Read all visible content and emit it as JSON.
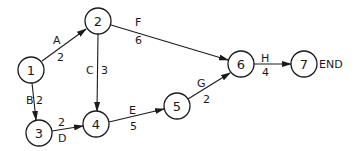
{
  "diagram": {
    "type": "activity-network",
    "nodes": [
      {
        "id": "1",
        "label": "1",
        "x": 31,
        "y": 70
      },
      {
        "id": "2",
        "label": "2",
        "x": 98,
        "y": 21
      },
      {
        "id": "3",
        "label": "3",
        "x": 39,
        "y": 133
      },
      {
        "id": "4",
        "label": "4",
        "x": 96,
        "y": 124
      },
      {
        "id": "5",
        "label": "5",
        "x": 177,
        "y": 106
      },
      {
        "id": "6",
        "label": "6",
        "x": 241,
        "y": 64
      },
      {
        "id": "7",
        "label": "7",
        "x": 304,
        "y": 64
      }
    ],
    "edges": [
      {
        "from": "1",
        "to": "2",
        "activity": "A",
        "duration": "2"
      },
      {
        "from": "1",
        "to": "3",
        "activity": "B",
        "duration": "2"
      },
      {
        "from": "2",
        "to": "4",
        "activity": "C",
        "duration": "3"
      },
      {
        "from": "3",
        "to": "4",
        "activity": "D",
        "duration": "2"
      },
      {
        "from": "4",
        "to": "5",
        "activity": "E",
        "duration": "5"
      },
      {
        "from": "2",
        "to": "6",
        "activity": "F",
        "duration": "6"
      },
      {
        "from": "5",
        "to": "6",
        "activity": "G",
        "duration": "2"
      },
      {
        "from": "6",
        "to": "7",
        "activity": "H",
        "duration": "4"
      }
    ],
    "end_label": "END"
  }
}
